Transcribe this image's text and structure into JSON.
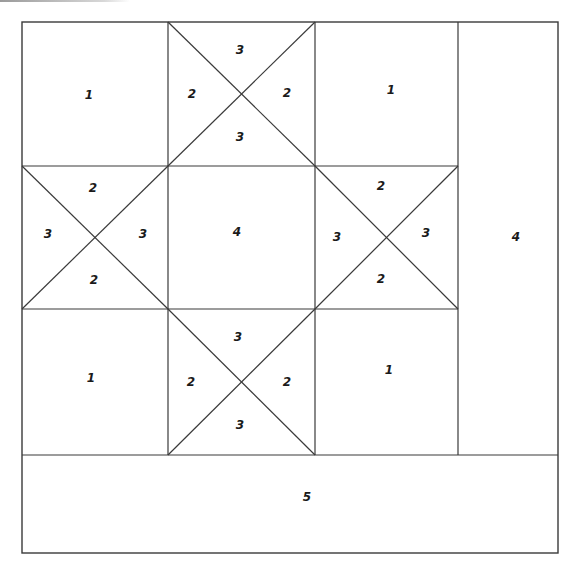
{
  "diagram": {
    "type": "quilt-block-piecing-diagram",
    "line_color": "#3a3a3a",
    "background": "#ffffff",
    "grid": {
      "outer": {
        "left": 22,
        "top": 22,
        "right": 558,
        "bottom": 553
      },
      "columns_x": [
        22,
        168,
        315,
        458,
        558
      ],
      "rows_y": [
        22,
        166,
        309,
        455,
        553
      ]
    },
    "pieces": [
      {
        "id": "top-left-square",
        "label": "1",
        "x": 89,
        "y": 95
      },
      {
        "id": "top-middle-tri-top",
        "label": "3",
        "x": 240,
        "y": 50
      },
      {
        "id": "top-middle-tri-left",
        "label": "2",
        "x": 192,
        "y": 94
      },
      {
        "id": "top-middle-tri-right",
        "label": "2",
        "x": 287,
        "y": 93
      },
      {
        "id": "top-middle-tri-bottom",
        "label": "3",
        "x": 240,
        "y": 137
      },
      {
        "id": "top-right-square",
        "label": "1",
        "x": 391,
        "y": 90
      },
      {
        "id": "middle-left-tri-top",
        "label": "2",
        "x": 93,
        "y": 188
      },
      {
        "id": "middle-left-tri-left",
        "label": "3",
        "x": 48,
        "y": 234
      },
      {
        "id": "middle-left-tri-right",
        "label": "3",
        "x": 143,
        "y": 234
      },
      {
        "id": "middle-left-tri-bottom",
        "label": "2",
        "x": 94,
        "y": 280
      },
      {
        "id": "center-square",
        "label": "4",
        "x": 237,
        "y": 232
      },
      {
        "id": "middle-right-tri-top",
        "label": "2",
        "x": 381,
        "y": 186
      },
      {
        "id": "middle-right-tri-left",
        "label": "3",
        "x": 337,
        "y": 237
      },
      {
        "id": "middle-right-tri-right",
        "label": "3",
        "x": 426,
        "y": 233
      },
      {
        "id": "middle-right-tri-bottom",
        "label": "2",
        "x": 381,
        "y": 279
      },
      {
        "id": "right-column-strip",
        "label": "4",
        "x": 516,
        "y": 237
      },
      {
        "id": "bottom-left-square",
        "label": "1",
        "x": 91,
        "y": 378
      },
      {
        "id": "bottom-middle-tri-top",
        "label": "3",
        "x": 238,
        "y": 337
      },
      {
        "id": "bottom-middle-tri-left",
        "label": "2",
        "x": 191,
        "y": 382
      },
      {
        "id": "bottom-middle-tri-right",
        "label": "2",
        "x": 287,
        "y": 382
      },
      {
        "id": "bottom-middle-tri-bottom",
        "label": "3",
        "x": 240,
        "y": 425
      },
      {
        "id": "bottom-right-square",
        "label": "1",
        "x": 389,
        "y": 370
      },
      {
        "id": "bottom-strip",
        "label": "5",
        "x": 307,
        "y": 497
      }
    ]
  }
}
